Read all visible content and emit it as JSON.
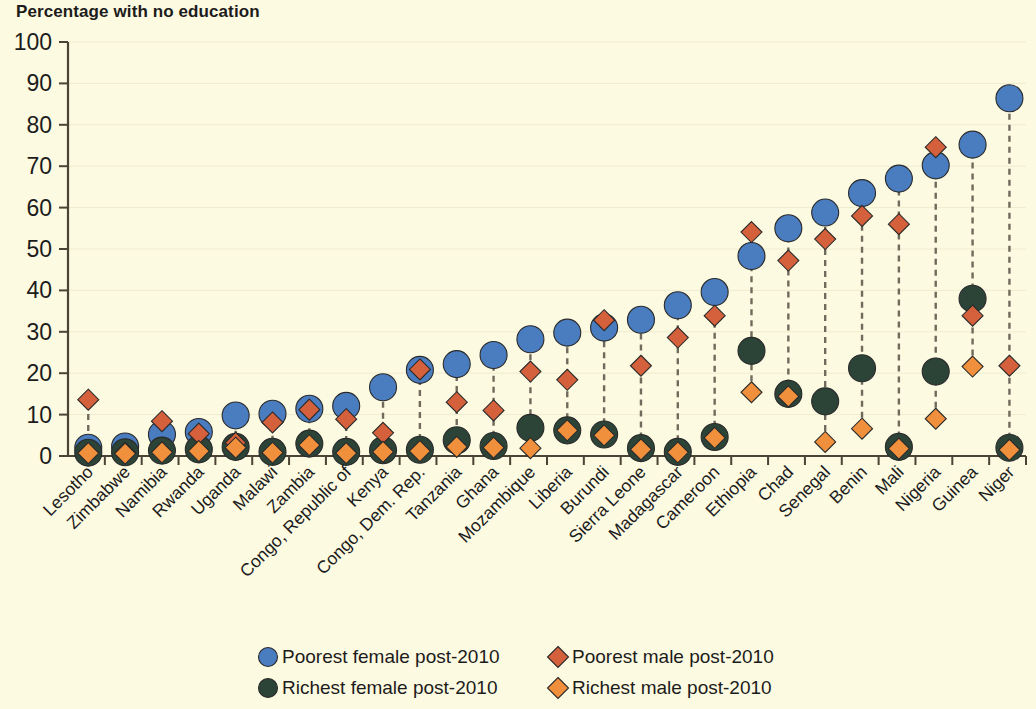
{
  "chart_data": {
    "type": "scatter",
    "title": "Percentage with no education",
    "xlabel": "",
    "ylabel": "",
    "ylim": [
      0,
      100
    ],
    "ytick_step": 10,
    "yticks": [
      0,
      10,
      20,
      30,
      40,
      50,
      60,
      70,
      80,
      90,
      100
    ],
    "grid": true,
    "legend_position": "bottom",
    "categories": [
      "Lesotho",
      "Zimbabwe",
      "Namibia",
      "Rwanda",
      "Uganda",
      "Malawi",
      "Zambia",
      "Congo, Republic of",
      "Kenya",
      "Congo, Dem. Rep.",
      "Tanzania",
      "Ghana",
      "Mozambique",
      "Liberia",
      "Burundi",
      "Sierra Leone",
      "Madagascar",
      "Cameroon",
      "Ethiopia",
      "Chad",
      "Senegal",
      "Benin",
      "Mali",
      "Nigeria",
      "Guinea",
      "Niger"
    ],
    "series": [
      {
        "name": "Poorest female post-2010",
        "marker": "circle",
        "color": "#4a7cc0",
        "values": [
          2.0,
          2.3,
          5.2,
          5.8,
          9.8,
          10.2,
          11.4,
          12.1,
          16.6,
          20.8,
          22.2,
          24.4,
          28.2,
          29.8,
          31.0,
          32.9,
          36.4,
          39.6,
          48.3,
          55.0,
          58.8,
          63.5,
          67.0,
          70.2,
          75.2,
          86.4
        ]
      },
      {
        "name": "Poorest male post-2010",
        "marker": "diamond",
        "color": "#d4603c",
        "values": [
          13.6,
          0.8,
          8.4,
          5.4,
          3.2,
          8.1,
          11.2,
          8.9,
          5.6,
          20.9,
          13.0,
          11.0,
          20.4,
          18.4,
          32.8,
          21.8,
          28.6,
          33.9,
          54.1,
          47.2,
          52.4,
          58.0,
          56.0,
          74.6,
          33.9,
          21.8
        ]
      },
      {
        "name": "Richest female post-2010",
        "marker": "circle",
        "color": "#2c4438",
        "values": [
          0.8,
          0.9,
          1.3,
          1.6,
          2.2,
          1.0,
          3.0,
          1.0,
          1.4,
          1.5,
          3.8,
          2.4,
          6.8,
          6.2,
          5.2,
          1.9,
          1.0,
          4.6,
          25.4,
          15.0,
          13.2,
          21.2,
          2.2,
          20.4,
          38.0,
          2.0
        ]
      },
      {
        "name": "Richest male post-2010",
        "marker": "diamond",
        "color": "#f0903c",
        "values": [
          0.7,
          0.6,
          0.9,
          1.2,
          2.0,
          0.8,
          2.6,
          0.7,
          1.0,
          1.2,
          2.2,
          2.0,
          1.9,
          6.2,
          5.0,
          1.6,
          0.9,
          4.4,
          15.4,
          14.4,
          3.4,
          6.6,
          1.8,
          9.0,
          21.6,
          1.5
        ]
      }
    ],
    "legend": [
      {
        "label": "Poorest female post-2010",
        "marker": "circle",
        "color": "#4a7cc0"
      },
      {
        "label": "Poorest male post-2010",
        "marker": "diamond",
        "color": "#d4603c"
      },
      {
        "label": "Richest female post-2010",
        "marker": "circle",
        "color": "#2c4438"
      },
      {
        "label": "Richest male post-2010",
        "marker": "diamond",
        "color": "#f0903c"
      }
    ]
  },
  "style": {
    "background": "#fcfae1",
    "axis_color": "#4a4336",
    "grid_color": "#efeccf",
    "connector_color": "#6f6a5c",
    "text_color": "#1c1c1c"
  }
}
